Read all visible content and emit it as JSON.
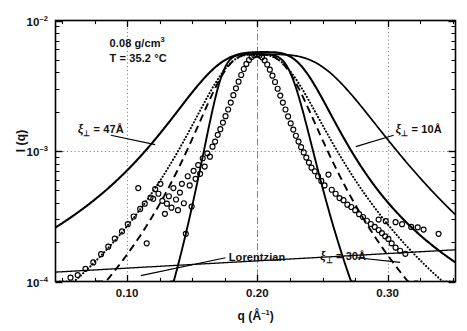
{
  "chart_data": {
    "type": "line",
    "title": "",
    "xlabel": "q (Å-1)",
    "ylabel": "I (q)",
    "xscale": "linear",
    "yscale": "log",
    "xlim": [
      0.045,
      0.352
    ],
    "ylim": [
      0.0001,
      0.01
    ],
    "grid": true,
    "gridlines": {
      "x": [
        0.1,
        0.2,
        0.3
      ],
      "y": [
        0.001
      ]
    },
    "xticks_major": [
      "0.10",
      "0.20",
      "0.30"
    ],
    "xticks_major_values": [
      0.1,
      0.2,
      0.3
    ],
    "xticks_minor_values": [
      0.05,
      0.075,
      0.125,
      0.15,
      0.175,
      0.225,
      0.25,
      0.275,
      0.325,
      0.35
    ],
    "yticks_major": [
      "10-2",
      "10-3",
      "10-4"
    ],
    "yticks_major_values": [
      0.01,
      0.001,
      0.0001
    ],
    "annotations": [
      {
        "id": "density",
        "text": "0.08 g/cm3",
        "x": 0.0865,
        "y": 0.0068
      },
      {
        "id": "temperature",
        "text": "T = 35.2 °C",
        "x": 0.0865,
        "y": 0.0052
      }
    ],
    "curve_labels": [
      {
        "id": "xi-47",
        "symbol": "ξ",
        "subscript": "⊥",
        "text": " = 47Å",
        "x": 0.062,
        "y": 0.00145
      },
      {
        "id": "xi-10",
        "symbol": "ξ",
        "subscript": "⊥",
        "text": " = 10Å",
        "x": 0.306,
        "y": 0.00145
      },
      {
        "id": "xi-30",
        "symbol": "ξ",
        "subscript": "⊥",
        "text": " = 30Å",
        "x": 0.248,
        "y": 0.000155
      },
      {
        "id": "lorentzian",
        "symbol": "",
        "subscript": "",
        "text": "Lorentzian",
        "x": 0.178,
        "y": 0.000155
      }
    ],
    "leaders": [
      {
        "id": "leader-47",
        "x1": 0.0875,
        "y1": 0.00132,
        "x2": 0.1215,
        "y2": 0.00112
      },
      {
        "id": "leader-10",
        "x1": 0.3045,
        "y1": 0.00132,
        "x2": 0.2755,
        "y2": 0.00108
      },
      {
        "id": "leader-30",
        "x1": 0.2765,
        "y1": 0.000152,
        "x2": 0.3095,
        "y2": 0.00014
      },
      {
        "id": "leader-lor",
        "x1": 0.1755,
        "y1": 0.000152,
        "x2": 0.1105,
        "y2": 0.000111
      }
    ],
    "series": [
      {
        "name": "xi-perp 47A",
        "style": "solid",
        "width": 2.1,
        "model": "peak",
        "q0": 0.2055,
        "amp": 0.0055,
        "w_left": 0.054,
        "w_right": 0.0405,
        "p_left": 1.62,
        "p_right": 1.72,
        "floor": 0.00022
      },
      {
        "name": "xi-perp 10A",
        "style": "solid",
        "width": 1.7,
        "model": "tail-right",
        "q0": 0.2075,
        "amp": 0.0055,
        "w_right": 0.064,
        "p_right": 1.7
      },
      {
        "name": "xi-perp 30A",
        "style": "solid",
        "width": 1.9,
        "model": "peak-narrow",
        "q0": 0.1985,
        "amp": 0.0055,
        "w_left": 0.03,
        "w_right": 0.0325,
        "p_left": 2.7,
        "p_right": 2.45,
        "floor": 0
      },
      {
        "name": "Lorentzian",
        "style": "solid",
        "width": 1.3,
        "model": "lorentz-base",
        "y_left": 0.000118,
        "y_right": 0.000175
      },
      {
        "name": "fit-dotted",
        "style": "dotted",
        "width": 2.0,
        "model": "data-fit",
        "q0": 0.1985,
        "amp": 0.0055,
        "w_left": 0.0355,
        "w_right": 0.038,
        "p_left": 1.46,
        "p_right": 1.5,
        "floor": 0
      },
      {
        "name": "fit-dashed",
        "style": "dashed",
        "width": 1.9,
        "model": "data-fit",
        "q0": 0.1985,
        "amp": 0.0055,
        "w_left": 0.033,
        "w_right": 0.0352,
        "p_left": 1.6,
        "p_right": 1.66,
        "floor": 0
      }
    ],
    "scatter": {
      "name": "measured intensity",
      "marker": "open-circle",
      "radius": 2.5,
      "points": [
        [
          0.0565,
          0.000107
        ],
        [
          0.062,
          0.000112
        ],
        [
          0.068,
          0.000125
        ],
        [
          0.074,
          0.00014
        ],
        [
          0.08,
          0.000162
        ],
        [
          0.0855,
          0.000185
        ],
        [
          0.0905,
          0.000213
        ],
        [
          0.096,
          0.000242
        ],
        [
          0.1005,
          0.000275
        ],
        [
          0.105,
          0.000315
        ],
        [
          0.1085,
          0.00052
        ],
        [
          0.11,
          0.00036
        ],
        [
          0.1135,
          0.000395
        ],
        [
          0.115,
          0.000196
        ],
        [
          0.118,
          0.00044
        ],
        [
          0.12,
          0.00043
        ],
        [
          0.1215,
          0.00051
        ],
        [
          0.124,
          0.00047
        ],
        [
          0.1255,
          0.00056
        ],
        [
          0.127,
          0.000415
        ],
        [
          0.129,
          0.00033
        ],
        [
          0.1305,
          0.000395
        ],
        [
          0.132,
          0.00045
        ],
        [
          0.134,
          0.000368
        ],
        [
          0.1355,
          0.00052
        ],
        [
          0.1375,
          0.000425
        ],
        [
          0.139,
          0.000352
        ],
        [
          0.1405,
          0.00048
        ],
        [
          0.142,
          0.00056
        ],
        [
          0.1435,
          0.000398
        ],
        [
          0.145,
          0.000232
        ],
        [
          0.1465,
          0.00064
        ],
        [
          0.148,
          0.000545
        ],
        [
          0.1495,
          0.000375
        ],
        [
          0.151,
          0.000705
        ],
        [
          0.1525,
          0.000612
        ],
        [
          0.1545,
          0.00078
        ],
        [
          0.156,
          0.000668
        ],
        [
          0.158,
          0.00088
        ],
        [
          0.1595,
          0.00076
        ],
        [
          0.1615,
          0.00096
        ],
        [
          0.1635,
          0.000905
        ],
        [
          0.1655,
          0.00108
        ],
        [
          0.1675,
          0.00118
        ],
        [
          0.1695,
          0.00133
        ],
        [
          0.1715,
          0.00147
        ],
        [
          0.1735,
          0.00165
        ],
        [
          0.1755,
          0.00185
        ],
        [
          0.1775,
          0.00208
        ],
        [
          0.1795,
          0.00235
        ],
        [
          0.1815,
          0.00268
        ],
        [
          0.1835,
          0.00302
        ],
        [
          0.1855,
          0.0034
        ],
        [
          0.1875,
          0.00382
        ],
        [
          0.1895,
          0.00425
        ],
        [
          0.1915,
          0.00465
        ],
        [
          0.1935,
          0.00498
        ],
        [
          0.1955,
          0.00525
        ],
        [
          0.1975,
          0.00542
        ],
        [
          0.1995,
          0.00548
        ],
        [
          0.2015,
          0.0054
        ],
        [
          0.2035,
          0.00522
        ],
        [
          0.2055,
          0.00495
        ],
        [
          0.2075,
          0.0046
        ],
        [
          0.2095,
          0.0042
        ],
        [
          0.2115,
          0.00378
        ],
        [
          0.2135,
          0.00338
        ],
        [
          0.2155,
          0.003
        ],
        [
          0.2175,
          0.00266
        ],
        [
          0.2195,
          0.00235
        ],
        [
          0.2215,
          0.00208
        ],
        [
          0.2235,
          0.00184
        ],
        [
          0.2255,
          0.00163
        ],
        [
          0.2275,
          0.00146
        ],
        [
          0.2295,
          0.00131
        ],
        [
          0.2315,
          0.00118
        ],
        [
          0.2335,
          0.00107
        ],
        [
          0.2355,
          0.000975
        ],
        [
          0.2375,
          0.00089
        ],
        [
          0.2395,
          0.000815
        ],
        [
          0.2415,
          0.000745
        ],
        [
          0.244,
          0.0007
        ],
        [
          0.2465,
          0.00064
        ],
        [
          0.249,
          0.00059
        ],
        [
          0.2515,
          0.000545
        ],
        [
          0.2545,
          0.00066
        ],
        [
          0.257,
          0.000505
        ],
        [
          0.26,
          0.00047
        ],
        [
          0.263,
          0.000436
        ],
        [
          0.266,
          0.00042
        ],
        [
          0.269,
          0.000388
        ],
        [
          0.272,
          0.000372
        ],
        [
          0.275,
          0.000352
        ],
        [
          0.278,
          0.000328
        ],
        [
          0.281,
          0.000312
        ],
        [
          0.284,
          0.000292
        ],
        [
          0.287,
          0.000276
        ],
        [
          0.29,
          0.000262
        ],
        [
          0.293,
          0.000248
        ],
        [
          0.2955,
          0.000235
        ],
        [
          0.298,
          0.000222
        ],
        [
          0.3005,
          0.000212
        ],
        [
          0.303,
          0.000196
        ],
        [
          0.306,
          0.000182
        ],
        [
          0.3095,
          0.000172
        ],
        [
          0.3135,
          0.000163
        ],
        [
          0.293,
          0.000298
        ],
        [
          0.2985,
          0.00029
        ],
        [
          0.306,
          0.000285
        ],
        [
          0.311,
          0.000275
        ],
        [
          0.318,
          0.000262
        ],
        [
          0.323,
          0.00026
        ],
        [
          0.3275,
          0.00025
        ],
        [
          0.339,
          0.000232
        ]
      ]
    }
  }
}
